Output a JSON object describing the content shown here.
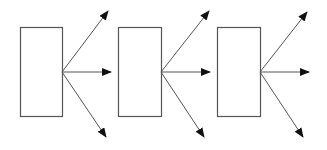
{
  "diagram": {
    "stroke": "#555555",
    "arrow_fill": "#111111",
    "background": "#ffffff",
    "units": [
      {
        "box": {
          "x": 20,
          "y": 27,
          "w": 42,
          "h": 89
        },
        "origin": [
          62,
          72
        ],
        "arrows": [
          {
            "to": [
              108,
              11
            ]
          },
          {
            "to": [
              111,
              72
            ]
          },
          {
            "to": [
              106,
              137
            ]
          }
        ]
      },
      {
        "box": {
          "x": 118,
          "y": 27,
          "w": 43,
          "h": 89
        },
        "origin": [
          161,
          72
        ],
        "arrows": [
          {
            "to": [
              209,
              11
            ]
          },
          {
            "to": [
              210,
              72
            ]
          },
          {
            "to": [
              204,
              137
            ]
          }
        ]
      },
      {
        "box": {
          "x": 217,
          "y": 27,
          "w": 43,
          "h": 89
        },
        "origin": [
          260,
          72
        ],
        "arrows": [
          {
            "to": [
              307,
              12
            ]
          },
          {
            "to": [
              309,
              72
            ]
          },
          {
            "to": [
              303,
              137
            ]
          }
        ]
      }
    ]
  }
}
